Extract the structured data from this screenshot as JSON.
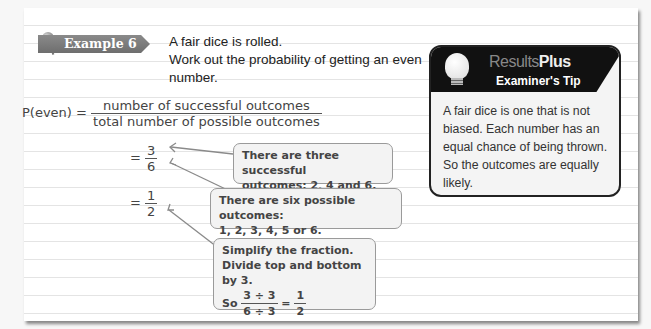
{
  "example": {
    "badge": "Example 6",
    "question_line1": "A fair dice is rolled.",
    "question_line2": "Work out the probability of getting an even",
    "question_line3": "number."
  },
  "working": {
    "lhs": "P(even) =",
    "fraction_num": "number of successful outcomes",
    "fraction_den": "total number of possible outcomes",
    "step1_eq": "=",
    "step1_num": "3",
    "step1_den": "6",
    "step2_eq": "=",
    "step2_num": "1",
    "step2_den": "2"
  },
  "notes": {
    "successful_line1": "There are three successful",
    "successful_line2": "outcomes: 2, 4 and 6.",
    "possible_line1": "There are six possible outcomes:",
    "possible_line2": "1, 2, 3, 4, 5 or 6.",
    "simplify_line1": "Simplify the fraction.",
    "simplify_line2": "Divide top and bottom by 3.",
    "simplify_so": "So",
    "simplify_num": "3 ÷ 3",
    "simplify_den": "6 ÷ 3",
    "simplify_eq": "=",
    "simplify_res_num": "1",
    "simplify_res_den": "2"
  },
  "tip": {
    "brand_light": "Results",
    "brand_bold": "Plus",
    "title": "Examiner's Tip",
    "body": "A fair dice is one that is not biased. Each number has an equal chance of being thrown. So the outcomes are equally likely."
  }
}
